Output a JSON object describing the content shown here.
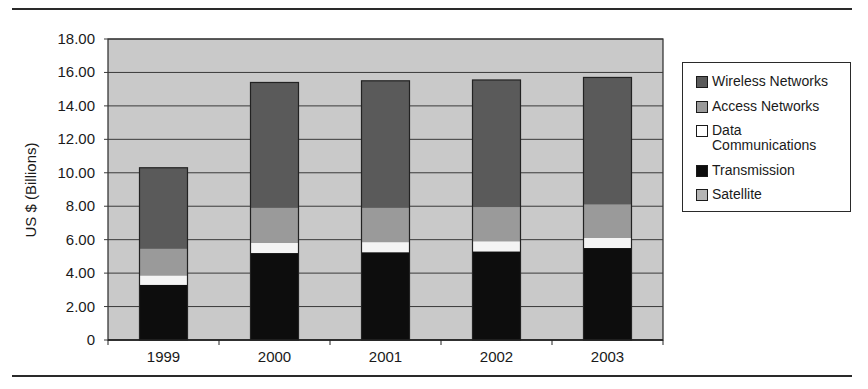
{
  "chart_data": {
    "type": "bar",
    "stacked": true,
    "title": "",
    "xlabel": "",
    "ylabel": "US $ (Billions)",
    "ylim": [
      0,
      18
    ],
    "yticks": [
      "0",
      "2.00",
      "4.00",
      "6.00",
      "8.00",
      "10.00",
      "12.00",
      "14.00",
      "16.00",
      "18.00"
    ],
    "grid": true,
    "legend_position": "right",
    "categories": [
      "1999",
      "2000",
      "2001",
      "2002",
      "2003"
    ],
    "series": [
      {
        "name": "Transmission",
        "color": "#0d0d0d",
        "values": [
          3.3,
          5.2,
          5.25,
          5.3,
          5.5
        ]
      },
      {
        "name": "Data Communications",
        "color": "#f4f4f4",
        "values": [
          0.55,
          0.6,
          0.6,
          0.6,
          0.6
        ]
      },
      {
        "name": "Access Networks",
        "color": "#9a9a9a",
        "values": [
          1.6,
          2.1,
          2.05,
          2.05,
          2.0
        ]
      },
      {
        "name": "Wireless Networks",
        "color": "#5a5a5a",
        "values": [
          4.85,
          7.5,
          7.6,
          7.6,
          7.6
        ]
      },
      {
        "name": "Satellite",
        "color": "#b4b4b4",
        "values": [
          0,
          0,
          0,
          0,
          0
        ]
      }
    ],
    "totals": [
      10.3,
      15.4,
      15.5,
      15.55,
      15.7
    ]
  },
  "legend": {
    "items": [
      {
        "label": "Wireless Networks",
        "color": "#5a5a5a"
      },
      {
        "label": "Access Networks",
        "color": "#9a9a9a"
      },
      {
        "label": "Data\nCommunications",
        "color": "#ffffff"
      },
      {
        "label": "Transmission",
        "color": "#0d0d0d"
      },
      {
        "label": "Satellite",
        "color": "#b4b4b4"
      }
    ]
  },
  "colors": {
    "plot_background": "#c9c9c9",
    "gridline": "#3a3a3a",
    "rule": "#2a2a2a"
  }
}
